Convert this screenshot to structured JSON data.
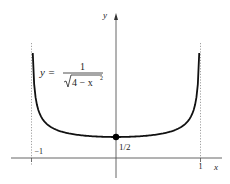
{
  "chart_data": {
    "type": "line",
    "title": "",
    "function_label": {
      "lhs": "y =",
      "numerator": "1",
      "radicand": "4 − x",
      "exponent": "2"
    },
    "xlabel": "x",
    "ylabel": "y",
    "x_ticks": [
      {
        "value": -1,
        "label": "−1"
      },
      {
        "value": 1,
        "label": "1"
      }
    ],
    "asymptotes_x": [
      -1,
      1
    ],
    "highlighted_point": {
      "x": 0,
      "y": 0.5,
      "label": "1/2"
    },
    "curve": {
      "x_domain": [
        -0.985,
        0.985
      ],
      "samples": 121,
      "shape_min_y": 0.5,
      "shape_max_y": 2.5
    },
    "xlim": [
      -1.38,
      1.35
    ],
    "ylim": [
      -0.6,
      3.7
    ],
    "grid": false,
    "legend": "none"
  }
}
